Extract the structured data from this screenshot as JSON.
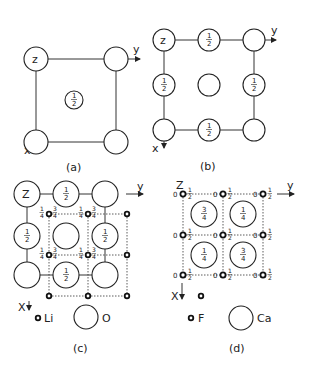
{
  "panels": {
    "a": {
      "caption": "(a)",
      "axis_x": "x",
      "axis_y": "y",
      "axis_z": "z",
      "center_height": "1/2",
      "description": "Body-centred cubic lattice projected on (001)"
    },
    "b": {
      "caption": "(b)",
      "axis_x": "x",
      "axis_y": "y",
      "axis_z": "z",
      "edge_height": "1/2",
      "description": "Face-centred cubic lattice projected on (001)"
    },
    "c": {
      "caption": "(c)",
      "axis_x": "X",
      "axis_y": "y",
      "axis_z": "Z",
      "small_atom_heights": [
        "1/4",
        "3/4"
      ],
      "large_atom_height": "1/2",
      "legend": [
        {
          "symbol": "small-dot",
          "label": "Li"
        },
        {
          "symbol": "large-circle",
          "label": "O"
        }
      ],
      "description": "Li2O antifluorite structure projected on (001)"
    },
    "d": {
      "caption": "(d)",
      "axis_x": "X",
      "axis_y": "y",
      "axis_z": "Z",
      "small_atom_heights": [
        "0",
        "1/2"
      ],
      "large_atom_heights": [
        "3/4",
        "1/4",
        "1/4",
        "3/4"
      ],
      "legend": [
        {
          "symbol": "small-dot",
          "label": "F"
        },
        {
          "symbol": "large-circle",
          "label": "Ca"
        }
      ],
      "description": "CaF2 fluorite structure projected on (001)"
    }
  },
  "fractions": {
    "half_num": "1",
    "half_den": "2",
    "quarter_num": "1",
    "quarter_den": "4",
    "three_q_num": "3",
    "three_q_den": "4",
    "zero": "0"
  }
}
